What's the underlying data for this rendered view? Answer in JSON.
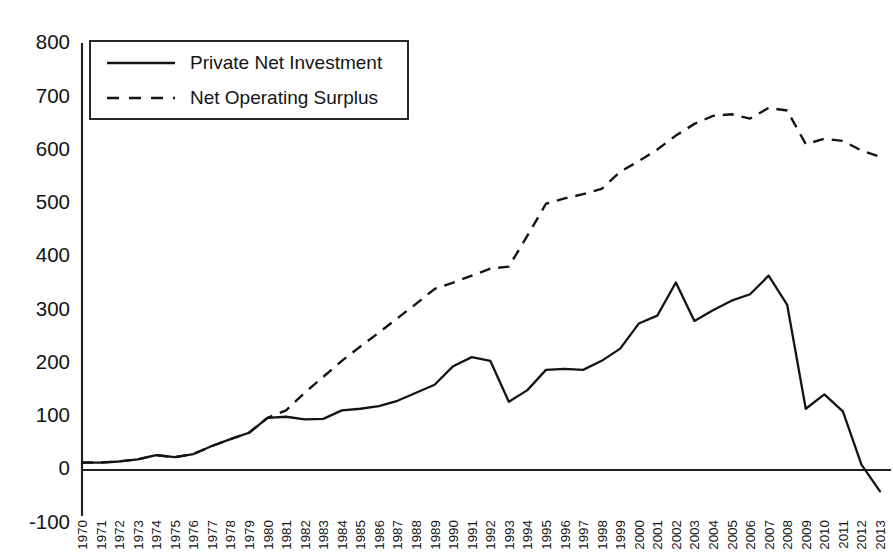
{
  "chart_data": {
    "type": "line",
    "title": "",
    "xlabel": "",
    "ylabel": "",
    "ylim": [
      -100,
      800
    ],
    "ytick_labels": [
      "800",
      "700",
      "600",
      "500",
      "400",
      "300",
      "200",
      "100",
      "0",
      "-100"
    ],
    "ytick_values": [
      800,
      700,
      600,
      500,
      400,
      300,
      200,
      100,
      0,
      -100
    ],
    "grid": false,
    "legend_position": "top-left",
    "x": [
      1970,
      1971,
      1972,
      1973,
      1974,
      1975,
      1976,
      1977,
      1978,
      1979,
      1980,
      1981,
      1982,
      1983,
      1984,
      1985,
      1986,
      1987,
      1988,
      1989,
      1990,
      1991,
      1992,
      1993,
      1994,
      1995,
      1996,
      1997,
      1998,
      1999,
      2000,
      2001,
      2002,
      2003,
      2004,
      2005,
      2006,
      2007,
      2008,
      2009,
      2010,
      2011,
      2012,
      2013
    ],
    "categories": [
      "1970",
      "1971",
      "1972",
      "1973",
      "1974",
      "1975",
      "1976",
      "1977",
      "1978",
      "1979",
      "1980",
      "1981",
      "1982",
      "1983",
      "1984",
      "1985",
      "1986",
      "1987",
      "1988",
      "1989",
      "1990",
      "1991",
      "1992",
      "1993",
      "1994",
      "1995",
      "1996",
      "1997",
      "1998",
      "1999",
      "2000",
      "2001",
      "2002",
      "2003",
      "2004",
      "2005",
      "2006",
      "2007",
      "2008",
      "2009",
      "2010",
      "2011",
      "2012",
      "2013"
    ],
    "series": [
      {
        "name": "Private Net Investment",
        "style": "solid",
        "values": [
          14,
          14,
          16,
          20,
          28,
          24,
          30,
          45,
          58,
          70,
          98,
          100,
          95,
          96,
          112,
          115,
          120,
          130,
          145,
          160,
          195,
          212,
          205,
          128,
          150,
          188,
          190,
          188,
          205,
          228,
          275,
          290,
          352,
          280,
          300,
          318,
          330,
          365,
          310,
          115,
          142,
          110,
          10,
          -40
        ]
      },
      {
        "name": "Net Operating Surplus",
        "style": "dashed",
        "values": [
          14,
          14,
          16,
          20,
          28,
          24,
          30,
          45,
          58,
          70,
          98,
          112,
          145,
          175,
          205,
          232,
          258,
          285,
          312,
          340,
          352,
          365,
          378,
          382,
          440,
          500,
          510,
          518,
          528,
          560,
          580,
          602,
          628,
          650,
          665,
          668,
          660,
          680,
          675,
          612,
          622,
          618,
          600,
          588
        ]
      }
    ]
  },
  "legend": {
    "entries": [
      {
        "label": "Private Net Investment",
        "style": "solid"
      },
      {
        "label": "Net Operating Surplus",
        "style": "dashed"
      }
    ]
  }
}
